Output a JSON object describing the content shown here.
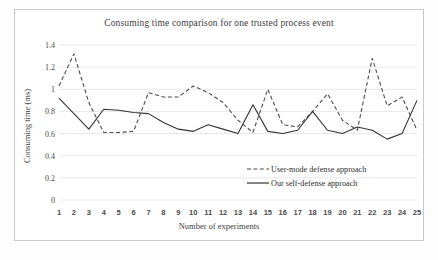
{
  "chart_data": {
    "type": "line",
    "title": "Consuming time comparison for one trusted process event",
    "xlabel": "Number of experiments",
    "ylabel": "Consuming time (ms)",
    "x": [
      1,
      2,
      3,
      4,
      5,
      6,
      7,
      8,
      9,
      10,
      11,
      12,
      13,
      14,
      15,
      16,
      17,
      18,
      19,
      20,
      21,
      22,
      23,
      24,
      25
    ],
    "xtick_labels": [
      "1",
      "2",
      "3",
      "4",
      "5",
      "6",
      "7",
      "8",
      "9",
      "10",
      "11",
      "12",
      "13",
      "14",
      "15",
      "16",
      "17",
      "18",
      "19",
      "20",
      "21",
      "22",
      "23",
      "24",
      "25"
    ],
    "ytick_labels": [
      "0",
      "0.2",
      "0.4",
      "0.6",
      "0.8",
      "1",
      "1.2",
      "1.4"
    ],
    "ytick_values": [
      0,
      0.2,
      0.4,
      0.6,
      0.8,
      1,
      1.2,
      1.4
    ],
    "ylim": [
      0,
      1.4
    ],
    "xlim": [
      1,
      25
    ],
    "grid": "horizontal",
    "legend_position": "inside-bottom-right",
    "series": [
      {
        "name": "User-mode defense approach",
        "style": "dashed",
        "color": "#4d4d4d",
        "values": [
          1.03,
          1.32,
          0.88,
          0.61,
          0.61,
          0.62,
          0.97,
          0.93,
          0.93,
          1.03,
          0.97,
          0.88,
          0.72,
          0.61,
          1.0,
          0.68,
          0.66,
          0.8,
          0.96,
          0.72,
          0.63,
          1.28,
          0.85,
          0.93,
          0.63
        ]
      },
      {
        "name": "Our self-defense approach",
        "style": "solid",
        "color": "#333333",
        "values": [
          0.92,
          0.78,
          0.64,
          0.82,
          0.81,
          0.79,
          0.78,
          0.7,
          0.64,
          0.62,
          0.68,
          0.64,
          0.6,
          0.86,
          0.62,
          0.6,
          0.63,
          0.8,
          0.63,
          0.6,
          0.66,
          0.63,
          0.55,
          0.6,
          0.9
        ]
      }
    ]
  },
  "legend": {
    "items": [
      {
        "label": "User-mode defense approach"
      },
      {
        "label": "Our self-defense approach"
      }
    ]
  }
}
